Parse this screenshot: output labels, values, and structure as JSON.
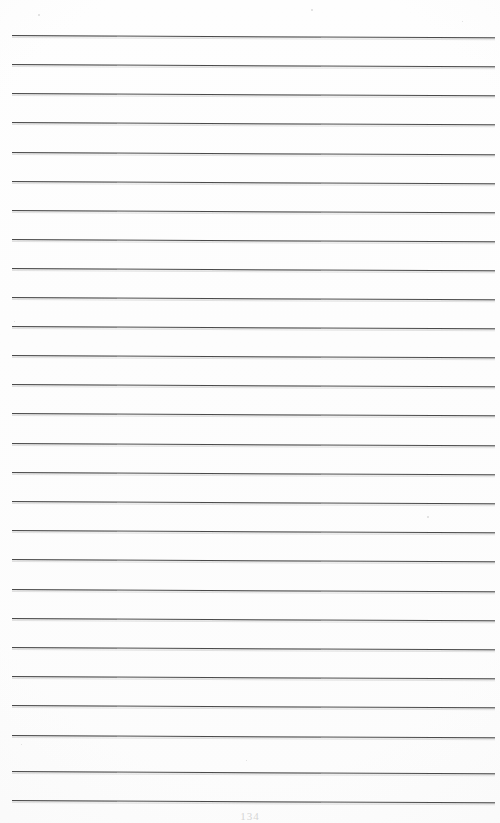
{
  "document": {
    "kind": "scanned-ruled-notebook-page",
    "page_number": "134",
    "background_color": "#fefefe",
    "rule_color": "#4a4a4a",
    "page_width": 500,
    "page_height": 823
  },
  "layout": {
    "rule_left_x": 12,
    "rule_right_x": 495,
    "first_rule_y": 35,
    "rule_spacing": 29.2,
    "rule_count": 27,
    "skew_degrees": 0.28
  },
  "rules": [
    {
      "index": 1,
      "y": 35
    },
    {
      "index": 2,
      "y": 64
    },
    {
      "index": 3,
      "y": 93
    },
    {
      "index": 4,
      "y": 122
    },
    {
      "index": 5,
      "y": 152
    },
    {
      "index": 6,
      "y": 181
    },
    {
      "index": 7,
      "y": 210
    },
    {
      "index": 8,
      "y": 239
    },
    {
      "index": 9,
      "y": 268
    },
    {
      "index": 10,
      "y": 297
    },
    {
      "index": 11,
      "y": 326
    },
    {
      "index": 12,
      "y": 355
    },
    {
      "index": 13,
      "y": 384
    },
    {
      "index": 14,
      "y": 413
    },
    {
      "index": 15,
      "y": 443
    },
    {
      "index": 16,
      "y": 472
    },
    {
      "index": 17,
      "y": 501
    },
    {
      "index": 18,
      "y": 530
    },
    {
      "index": 19,
      "y": 559
    },
    {
      "index": 20,
      "y": 589
    },
    {
      "index": 21,
      "y": 618
    },
    {
      "index": 22,
      "y": 647
    },
    {
      "index": 23,
      "y": 676
    },
    {
      "index": 24,
      "y": 705
    },
    {
      "index": 25,
      "y": 735
    },
    {
      "index": 26,
      "y": 771
    },
    {
      "index": 27,
      "y": 800
    }
  ],
  "specks": [
    {
      "x": 38,
      "y": 14,
      "size": 2
    },
    {
      "x": 311,
      "y": 9,
      "size": 2
    },
    {
      "x": 462,
      "y": 21,
      "size": 1
    },
    {
      "x": 14,
      "y": 321,
      "size": 1
    },
    {
      "x": 427,
      "y": 516,
      "size": 2
    },
    {
      "x": 21,
      "y": 744,
      "size": 1
    },
    {
      "x": 246,
      "y": 760,
      "size": 1
    }
  ]
}
